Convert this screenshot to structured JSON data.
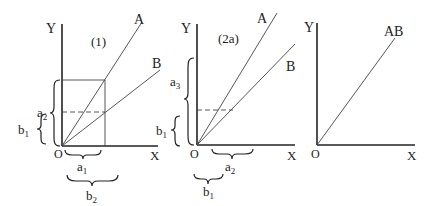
{
  "panels": [
    {
      "title": "(1)",
      "y_axis": "Y",
      "x_axis": "X",
      "origin": "O",
      "lines": [
        "A",
        "B"
      ],
      "braces": {
        "left_outer": {
          "base": "a",
          "sub": "2"
        },
        "left_inner": {
          "base": "b",
          "sub": "1"
        },
        "bottom_inner": {
          "base": "a",
          "sub": "1"
        },
        "bottom_outer": {
          "base": "b",
          "sub": "2"
        }
      }
    },
    {
      "title": "(2a)",
      "y_axis": "Y",
      "x_axis": "X",
      "origin": "O",
      "lines": [
        "A",
        "B"
      ],
      "braces": {
        "left_outer": {
          "base": "a",
          "sub": "3"
        },
        "left_inner": {
          "base": "b",
          "sub": "1"
        },
        "bottom_inner": {
          "base": "a",
          "sub": "2"
        },
        "bottom_outer": {
          "base": "b",
          "sub": "1"
        }
      }
    },
    {
      "title": "",
      "y_axis": "Y",
      "x_axis": "X",
      "origin": "O",
      "lines": [
        "AB"
      ]
    }
  ]
}
